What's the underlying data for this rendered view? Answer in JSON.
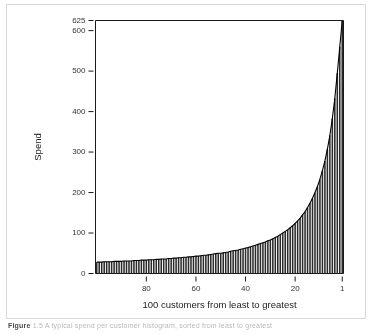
{
  "figure": {
    "background_color": "#ffffff",
    "frame_color": "#d8d8d8",
    "axis_color": "#1a1a1a",
    "bar_color": "#2b2b2b",
    "caption_prefix": "Figure",
    "caption_text": "1.5 A typical spend per customer histogram, sorted from least to greatest"
  },
  "chart_data": {
    "type": "bar",
    "title": "",
    "xlabel": "100 customers from least to greatest",
    "ylabel": "Spend",
    "xlim": [
      100.5,
      0.5
    ],
    "ylim": [
      0,
      625
    ],
    "x_reversed": true,
    "grid": false,
    "legend": null,
    "xticks": [
      80,
      60,
      40,
      20,
      1
    ],
    "xticklabels": [
      "80",
      "60",
      "40",
      "20",
      "1"
    ],
    "yticks": [
      0,
      100,
      200,
      300,
      400,
      500,
      600,
      625
    ],
    "yticklabels": [
      "0",
      "100",
      "200",
      "300",
      "400",
      "500",
      "600",
      "625"
    ],
    "n_bars": 100,
    "categories": [
      100,
      99,
      98,
      97,
      96,
      95,
      94,
      93,
      92,
      91,
      90,
      89,
      88,
      87,
      86,
      85,
      84,
      83,
      82,
      81,
      80,
      79,
      78,
      77,
      76,
      75,
      74,
      73,
      72,
      71,
      70,
      69,
      68,
      67,
      66,
      65,
      64,
      63,
      62,
      61,
      60,
      59,
      58,
      57,
      56,
      55,
      54,
      53,
      52,
      51,
      50,
      49,
      48,
      47,
      46,
      45,
      44,
      43,
      42,
      41,
      40,
      39,
      38,
      37,
      36,
      35,
      34,
      33,
      32,
      31,
      30,
      29,
      28,
      27,
      26,
      25,
      24,
      23,
      22,
      21,
      20,
      19,
      18,
      17,
      16,
      15,
      14,
      13,
      12,
      11,
      10,
      9,
      8,
      7,
      6,
      5,
      4,
      3,
      2,
      1
    ],
    "values": [
      28,
      28,
      28,
      29,
      29,
      29,
      29,
      30,
      30,
      30,
      30,
      31,
      31,
      31,
      31,
      32,
      32,
      32,
      33,
      33,
      33,
      34,
      34,
      34,
      35,
      35,
      36,
      36,
      36,
      37,
      37,
      38,
      38,
      39,
      39,
      40,
      40,
      41,
      41,
      42,
      43,
      43,
      44,
      45,
      45,
      46,
      47,
      48,
      49,
      50,
      50,
      51,
      52,
      53,
      55,
      56,
      57,
      58,
      60,
      61,
      63,
      64,
      66,
      68,
      70,
      72,
      74,
      76,
      78,
      81,
      83,
      86,
      89,
      92,
      96,
      100,
      104,
      108,
      113,
      118,
      124,
      130,
      137,
      145,
      153,
      163,
      174,
      186,
      200,
      215,
      233,
      254,
      278,
      307,
      341,
      383,
      433,
      495,
      560,
      625
    ]
  }
}
